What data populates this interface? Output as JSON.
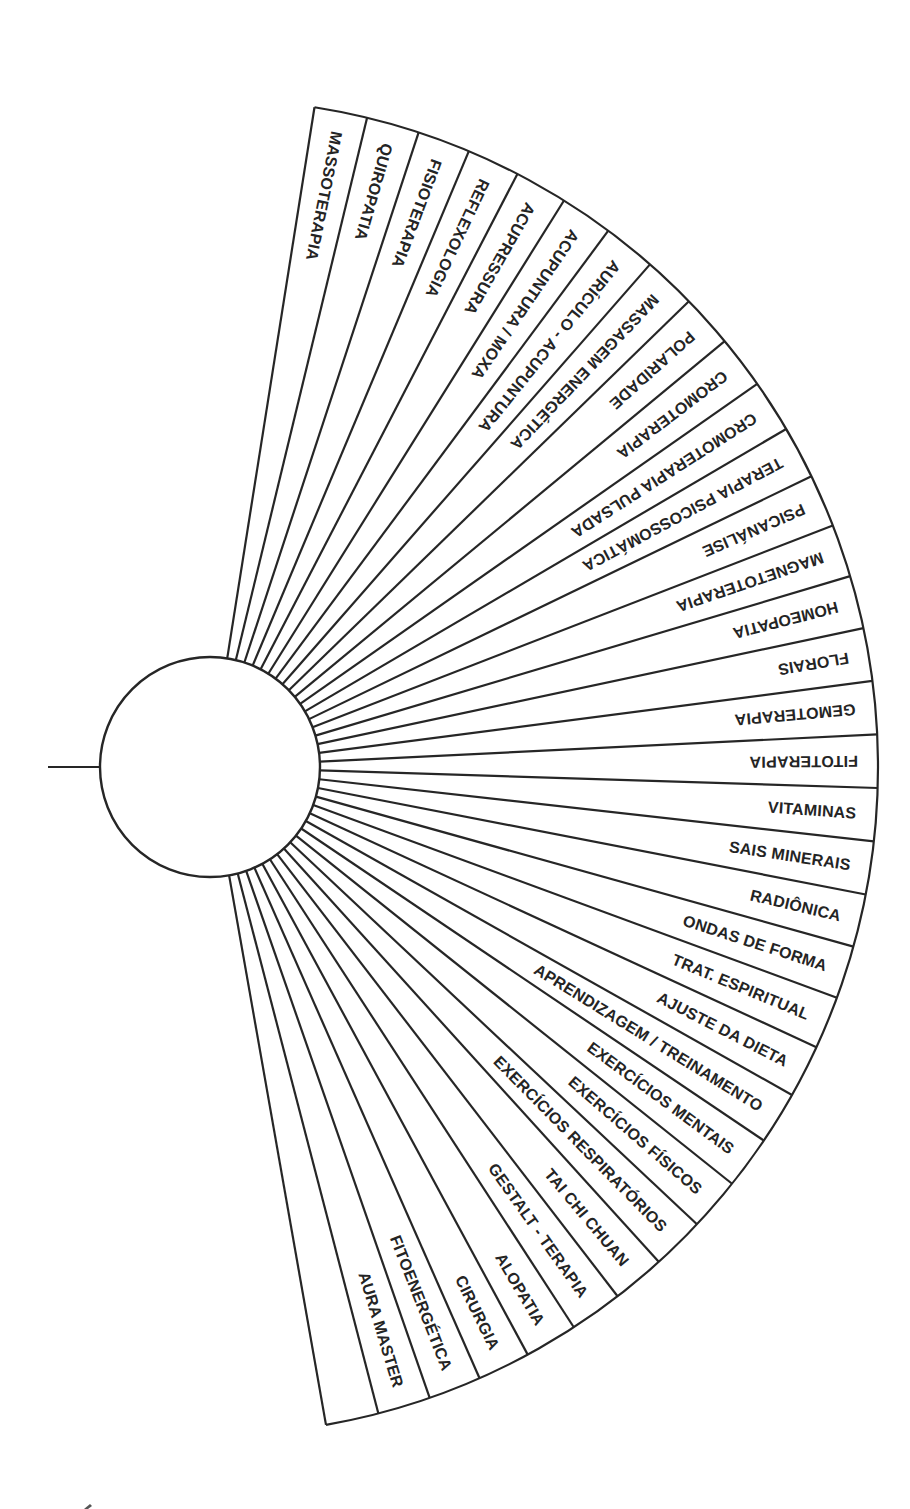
{
  "diagram": {
    "type": "radial-fan-chart",
    "colors": {
      "line": "#262626",
      "text": "#242424",
      "background": "#ffffff"
    },
    "geometry": {
      "center_x": 210,
      "center_y": 767,
      "hub_radius": 110,
      "outer_radius": 668,
      "start_angle_deg": -81,
      "end_angle_deg": 80,
      "stub_line": {
        "x1": 48,
        "x2": 100,
        "y": 767
      }
    },
    "wedges": [
      {
        "label": "MASSOTERAPIA"
      },
      {
        "label": "QUIROPATIA"
      },
      {
        "label": "FISIOTERAPIA"
      },
      {
        "label": "REFLEXOLOGIA"
      },
      {
        "label": "ACUPRESSURA"
      },
      {
        "label": "ACUPUNTURA / MOXA"
      },
      {
        "label": "AURÍCULO - ACUPUNTURA"
      },
      {
        "label": "MASSAGEM ENERGÉTICA"
      },
      {
        "label": "POLARIDADE"
      },
      {
        "label": "CROMOTERAPIA"
      },
      {
        "label": "CROMOTERAPIA PULSADA"
      },
      {
        "label": "TERAPIA PSICOSSOMÁTICA"
      },
      {
        "label": "PSICANÁLISE"
      },
      {
        "label": "MAGNETOTERAPIA"
      },
      {
        "label": "HOMEOPATIA"
      },
      {
        "label": "FLORAIS"
      },
      {
        "label": "GEMOTERAPIA"
      },
      {
        "label": "FITOTERAPIA"
      },
      {
        "label": "VITAMINAS"
      },
      {
        "label": "SAIS MINERAIS"
      },
      {
        "label": "RADIÔNICA"
      },
      {
        "label": "ONDAS DE FORMA"
      },
      {
        "label": "TRAT. ESPIRITUAL"
      },
      {
        "label": "AJUSTE DA DIETA"
      },
      {
        "label": "APRENDIZAGEM / TREINAMENTO"
      },
      {
        "label": "EXERCÍCIOS MENTAIS"
      },
      {
        "label": "EXERCÍCIOS FÍSICOS"
      },
      {
        "label": "EXERCÍCIOS RESPIRATÓRIOS"
      },
      {
        "label": "TAI CHI CHUAN"
      },
      {
        "label": "GESTALT - TERAPIA"
      },
      {
        "label": "ALOPATIA"
      },
      {
        "label": "CIRURGIA"
      },
      {
        "label": "FITOENERGÉTICA"
      },
      {
        "label": "AURA MASTER"
      },
      {
        "label": ""
      }
    ]
  }
}
